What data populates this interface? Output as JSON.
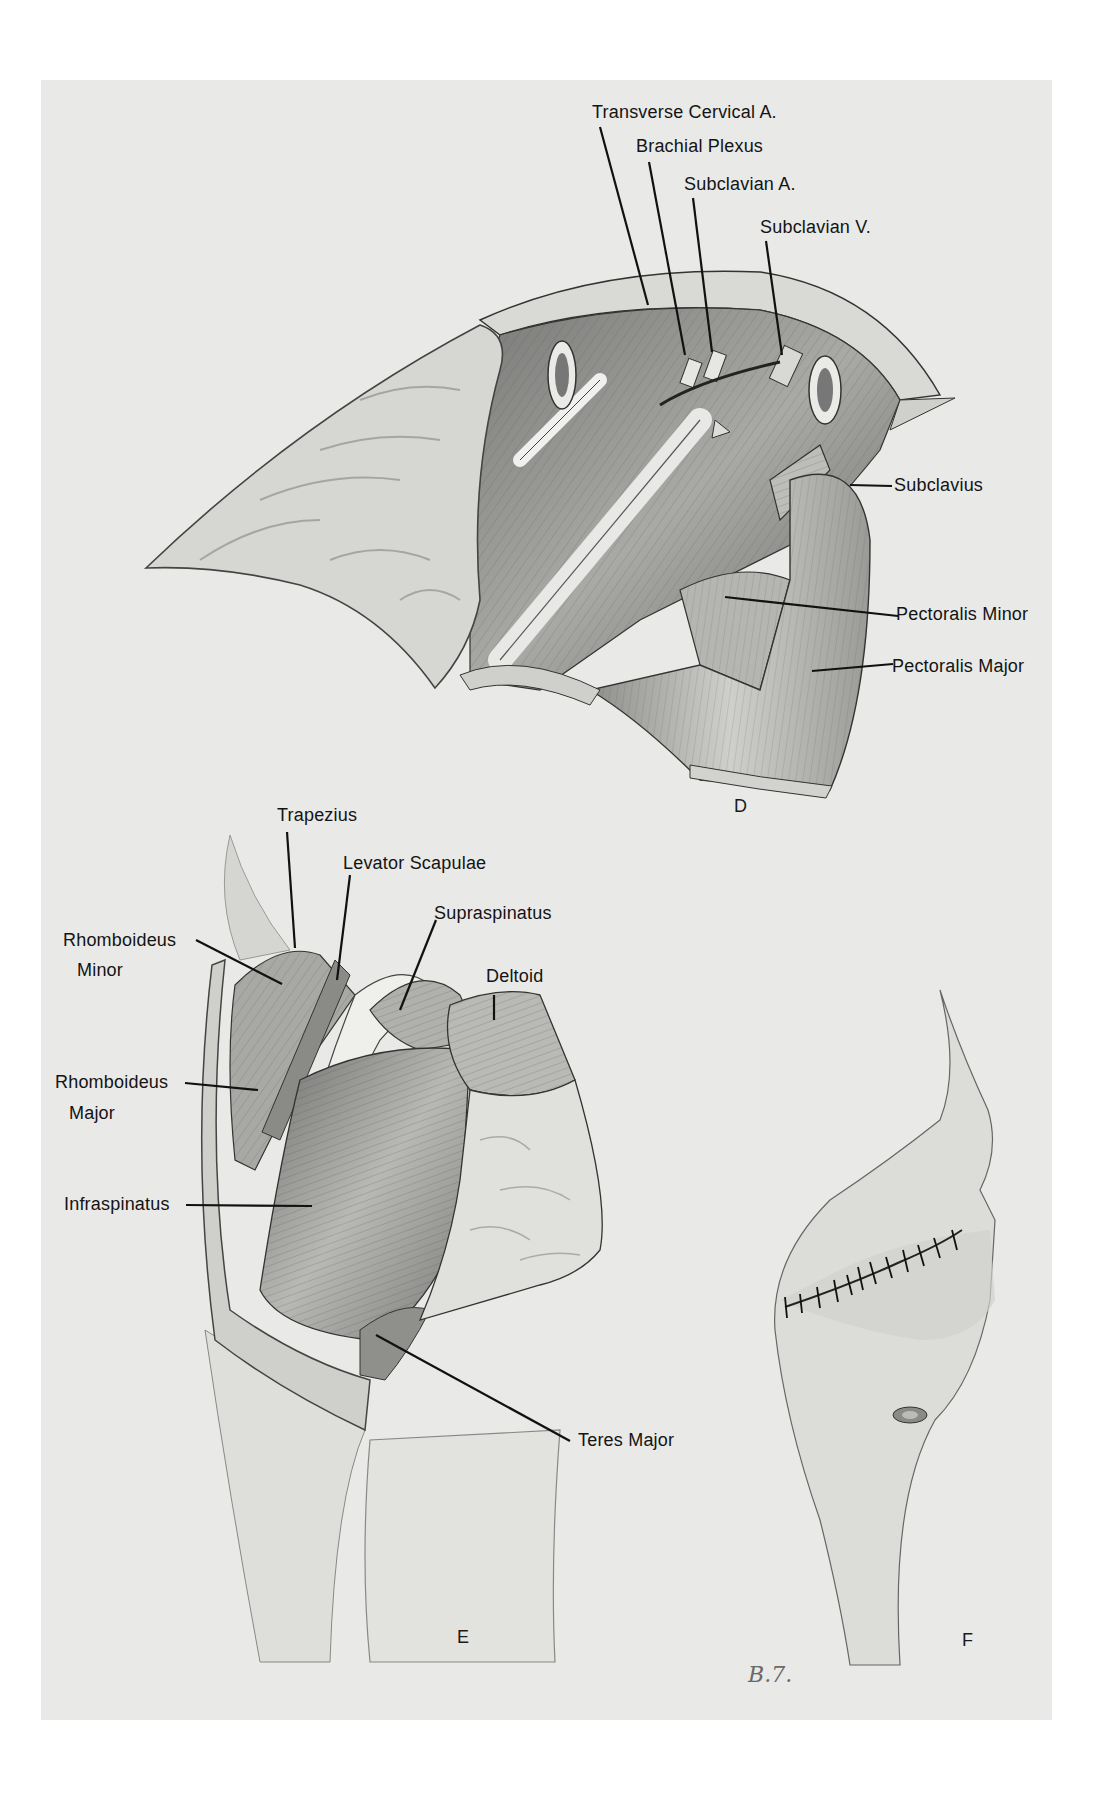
{
  "figure": {
    "panels": [
      {
        "id": "D",
        "letter": "D",
        "labels": {
          "transverse_cervical_a": "Transverse Cervical A.",
          "brachial_plexus": "Brachial Plexus",
          "subclavian_a": "Subclavian A.",
          "subclavian_v": "Subclavian V.",
          "subclavius": "Subclavius",
          "pectoralis_minor": "Pectoralis Minor",
          "pectoralis_major": "Pectoralis Major"
        }
      },
      {
        "id": "E",
        "letter": "E",
        "labels": {
          "trapezius": "Trapezius",
          "levator_scapulae": "Levator Scapulae",
          "supraspinatus": "Supraspinatus",
          "deltoid": "Deltoid",
          "rhomboideus_minor_1": "Rhomboideus",
          "rhomboideus_minor_2": "Minor",
          "rhomboideus_major_1": "Rhomboideus",
          "rhomboideus_major_2": "Major",
          "infraspinatus": "Infraspinatus",
          "teres_major": "Teres Major"
        }
      },
      {
        "id": "F",
        "letter": "F"
      }
    ],
    "signature": "B.7."
  },
  "colors": {
    "paper": "#e9e9e7",
    "ink": "#141414"
  }
}
